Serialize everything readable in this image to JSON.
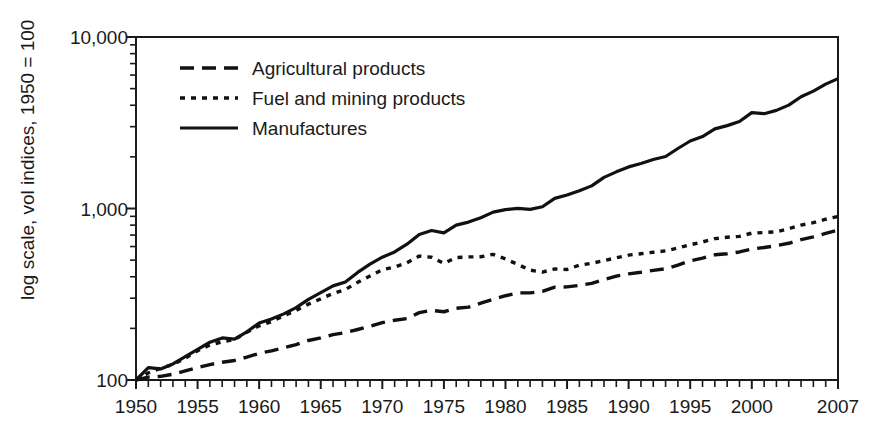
{
  "chart_data": {
    "type": "line",
    "title": "",
    "subtitle": "",
    "xlabel": "",
    "ylabel": "log scale, vol indices, 1950 = 100",
    "yscale": "log",
    "ylim": [
      100,
      10000
    ],
    "xlim": [
      1950,
      2007
    ],
    "grid": false,
    "legend_position": "top-left inside plot",
    "y_tick_labels": [
      "10,000",
      "1,000",
      "100"
    ],
    "y_tick_values": [
      10000,
      1000,
      100
    ],
    "y_minor_ticks": [
      200,
      300,
      400,
      500,
      600,
      700,
      800,
      900,
      2000,
      3000,
      4000,
      5000,
      6000,
      7000,
      8000,
      9000
    ],
    "x_tick_labels": [
      "1950",
      "1955",
      "1960",
      "1965",
      "1970",
      "1975",
      "1980",
      "1985",
      "1990",
      "1995",
      "2000",
      "2007"
    ],
    "x_tick_values": [
      1950,
      1955,
      1960,
      1965,
      1970,
      1975,
      1980,
      1985,
      1990,
      1995,
      2000,
      2007
    ],
    "x_minor_tick_interval": 1,
    "x": [
      1950,
      1951,
      1952,
      1953,
      1954,
      1955,
      1956,
      1957,
      1958,
      1959,
      1960,
      1961,
      1962,
      1963,
      1964,
      1965,
      1966,
      1967,
      1968,
      1969,
      1970,
      1971,
      1972,
      1973,
      1974,
      1975,
      1976,
      1977,
      1978,
      1979,
      1980,
      1981,
      1982,
      1983,
      1984,
      1985,
      1986,
      1987,
      1988,
      1989,
      1990,
      1991,
      1992,
      1993,
      1994,
      1995,
      1996,
      1997,
      1998,
      1999,
      2000,
      2001,
      2002,
      2003,
      2004,
      2005,
      2006,
      2007
    ],
    "series": [
      {
        "name": "Agricultural products",
        "style": "dashed",
        "color": "#111111",
        "values": [
          100,
          104,
          105,
          108,
          113,
          118,
          123,
          127,
          130,
          136,
          143,
          148,
          154,
          161,
          170,
          176,
          184,
          189,
          197,
          206,
          216,
          223,
          228,
          247,
          255,
          250,
          262,
          266,
          281,
          295,
          310,
          322,
          322,
          329,
          348,
          349,
          356,
          366,
          385,
          403,
          416,
          425,
          436,
          445,
          468,
          495,
          513,
          537,
          545,
          558,
          580,
          592,
          607,
          627,
          659,
          684,
          716,
          748
        ]
      },
      {
        "name": "Fuel and mining products",
        "style": "dotted",
        "color": "#111111",
        "values": [
          100,
          110,
          117,
          123,
          134,
          148,
          160,
          167,
          172,
          190,
          207,
          219,
          237,
          255,
          277,
          297,
          320,
          337,
          371,
          404,
          440,
          455,
          483,
          528,
          520,
          478,
          518,
          522,
          523,
          540,
          508,
          472,
          437,
          426,
          444,
          441,
          468,
          479,
          497,
          516,
          535,
          545,
          556,
          566,
          589,
          614,
          638,
          667,
          680,
          688,
          718,
          724,
          731,
          762,
          800,
          827,
          866,
          898
        ]
      },
      {
        "name": "Manufactures",
        "style": "solid",
        "color": "#111111",
        "values": [
          100,
          118,
          116,
          124,
          137,
          151,
          166,
          176,
          173,
          191,
          215,
          227,
          243,
          264,
          295,
          323,
          354,
          373,
          424,
          474,
          520,
          558,
          619,
          706,
          744,
          721,
          800,
          833,
          884,
          952,
          985,
          1002,
          988,
          1024,
          1145,
          1198,
          1270,
          1355,
          1519,
          1636,
          1748,
          1830,
          1931,
          2010,
          2238,
          2475,
          2628,
          2914,
          3043,
          3214,
          3624,
          3571,
          3733,
          4005,
          4483,
          4835,
          5310,
          5720
        ]
      }
    ],
    "legend": [
      {
        "label": "Agricultural products",
        "style": "dashed"
      },
      {
        "label": "Fuel and mining products",
        "style": "dotted"
      },
      {
        "label": "Manufactures",
        "style": "solid"
      }
    ]
  }
}
